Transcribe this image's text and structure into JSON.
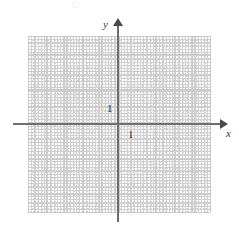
{
  "figure": {
    "kind": "cartesian-coordinate-grid",
    "title": "",
    "background_color": "#ffffff"
  },
  "axes": {
    "x": {
      "label": "x",
      "unit_label": "1",
      "arrow": "right",
      "color": "#6e6e6e"
    },
    "y": {
      "label": "y",
      "unit_label": "1",
      "arrow": "up",
      "color": "#6e6e6e"
    }
  },
  "grid": {
    "major_color": "#c9c9c9",
    "minor_color": "#d5d5d5",
    "columns": 10,
    "rows": 10,
    "minor_per_major": 4,
    "origin_column": 5,
    "origin_row": 5
  },
  "chart_data": {
    "type": "scatter",
    "title": "",
    "xlabel": "x",
    "ylabel": "y",
    "xlim": [
      -5,
      5
    ],
    "ylim": [
      -5,
      5
    ],
    "xticks": [
      -5,
      -4,
      -3,
      -2,
      -1,
      0,
      1,
      2,
      3,
      4,
      5
    ],
    "yticks": [
      -5,
      -4,
      -3,
      -2,
      -1,
      0,
      1,
      2,
      3,
      4,
      5
    ],
    "xtick_labels": [
      "",
      "",
      "",
      "",
      "",
      "",
      "1",
      "",
      "",
      "",
      ""
    ],
    "ytick_labels": [
      "",
      "",
      "",
      "",
      "",
      "",
      "1",
      "",
      "",
      "",
      ""
    ],
    "grid": true,
    "minor_grid": true,
    "legend": null,
    "series": [],
    "x": [],
    "y": [],
    "annotations": [
      {
        "text": "1",
        "x": 1,
        "y": 0,
        "placement": "below-right-of-origin"
      },
      {
        "text": "1",
        "x": 0,
        "y": 1,
        "placement": "left-of-y-axis"
      },
      {
        "text": "x",
        "x": 5.6,
        "y": -0.3,
        "placement": "end-of-x-axis"
      },
      {
        "text": "y",
        "x": -0.5,
        "y": 5.5,
        "placement": "end-of-y-axis"
      }
    ]
  }
}
